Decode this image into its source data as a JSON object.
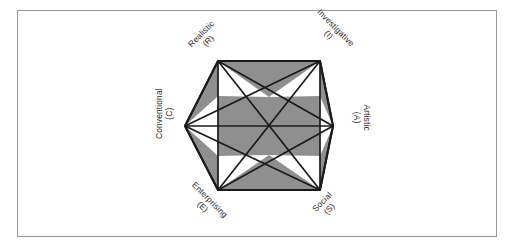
{
  "figure": {
    "kind": "hexagon-diagram",
    "frame": {
      "border_color": "#9a9a9a",
      "background_color": "#ffffff"
    },
    "colors": {
      "shade_fill": "#8f8f8f",
      "line_stroke": "#1a1a1a",
      "white_fill": "#ffffff",
      "label_text": "#2b2b2b"
    },
    "labels": [
      {
        "id": "realistic",
        "name": "Realistic",
        "code": "(R)",
        "position": "upper-left",
        "rotation_deg": -45
      },
      {
        "id": "investigative",
        "name": "Investigative",
        "code": "(I)",
        "position": "upper-right",
        "rotation_deg": 45
      },
      {
        "id": "artistic",
        "name": "Artistic",
        "code": "(A)",
        "position": "right",
        "rotation_deg": 90
      },
      {
        "id": "social",
        "name": "Social",
        "code": "(S)",
        "position": "lower-right",
        "rotation_deg": -45
      },
      {
        "id": "enterprising",
        "name": "Enterprising",
        "code": "(E)",
        "position": "lower-left",
        "rotation_deg": 45
      },
      {
        "id": "conventional",
        "name": "Conventional",
        "code": "(C)",
        "position": "left",
        "rotation_deg": -90
      }
    ],
    "vertices": [
      {
        "id": "realistic",
        "x": 218,
        "y": 61
      },
      {
        "id": "investigative",
        "x": 320,
        "y": 61
      },
      {
        "id": "artistic",
        "x": 333,
        "y": 126
      },
      {
        "id": "social",
        "x": 320,
        "y": 190
      },
      {
        "id": "enterprising",
        "x": 218,
        "y": 190
      },
      {
        "id": "conventional",
        "x": 185,
        "y": 126
      }
    ]
  }
}
